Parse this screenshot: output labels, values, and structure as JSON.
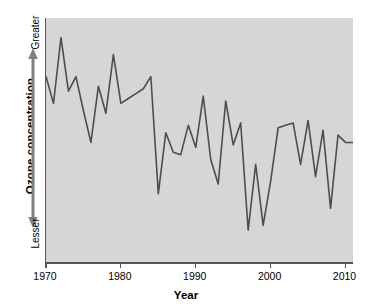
{
  "chart_data": {
    "type": "line",
    "title": "",
    "xlabel": "Year",
    "ylabel": "Ozone concentration",
    "grid": false,
    "legend": null,
    "xlim": [
      1970,
      2011
    ],
    "ylim": [
      0,
      100
    ],
    "y_axis_qualitative": true,
    "y_axis_top_label": "Greater",
    "y_axis_bottom_label": "Lesser",
    "y_tick_labels": [],
    "x_tick_labels": [
      "1970",
      "1980",
      "1990",
      "2000",
      "2010"
    ],
    "x_ticks": [
      1970,
      1980,
      1990,
      2000,
      2010
    ],
    "series": [
      {
        "name": "Ozone concentration",
        "color": "#4d4d4d",
        "x": [
          1970,
          1971,
          1972,
          1973,
          1974,
          1975,
          1976,
          1977,
          1978,
          1979,
          1980,
          1981,
          1982,
          1983,
          1984,
          1985,
          1986,
          1987,
          1988,
          1989,
          1990,
          1991,
          1992,
          1993,
          1994,
          1995,
          1996,
          1997,
          1998,
          1999,
          2000,
          2001,
          2002,
          2003,
          2004,
          2005,
          2006,
          2007,
          2008,
          2009,
          2010,
          2011
        ],
        "values": [
          76,
          65,
          92,
          70,
          76,
          62,
          49,
          72,
          61,
          85,
          65,
          67,
          69,
          71,
          76,
          28,
          53,
          45,
          44,
          56,
          47,
          68,
          42,
          32,
          66,
          48,
          57,
          13,
          40,
          15,
          33,
          55,
          56,
          57,
          40,
          58,
          35,
          54,
          22,
          52,
          49,
          49
        ]
      }
    ]
  }
}
